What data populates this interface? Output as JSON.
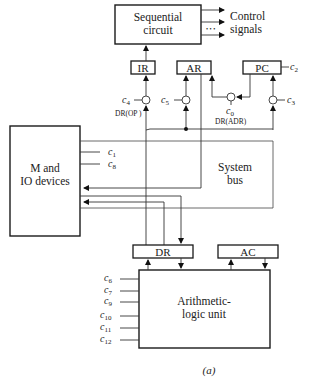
{
  "blocks": {
    "sequential_circuit": [
      "Sequential",
      "circuit"
    ],
    "control_signals": [
      "Control",
      "signals"
    ],
    "control_dots": "• • •",
    "ir": "IR",
    "ar": "AR",
    "pc": "PC",
    "m_io": [
      "M and",
      "IO devices"
    ],
    "system_bus": [
      "System",
      "bus"
    ],
    "dr": "DR",
    "ac": "AC",
    "alu": [
      "Arithmetic-",
      "logic unit"
    ]
  },
  "signals": {
    "c0": {
      "base": "c",
      "sub": "0"
    },
    "c1": {
      "base": "c",
      "sub": "1"
    },
    "c2": {
      "base": "c",
      "sub": "2"
    },
    "c3": {
      "base": "c",
      "sub": "3"
    },
    "c4": {
      "base": "c",
      "sub": "4"
    },
    "c5": {
      "base": "c",
      "sub": "5"
    },
    "c6": {
      "base": "c",
      "sub": "6"
    },
    "c7": {
      "base": "c",
      "sub": "7"
    },
    "c8": {
      "base": "c",
      "sub": "8"
    },
    "c9": {
      "base": "c",
      "sub": "9"
    },
    "c10": {
      "base": "c",
      "sub": "10"
    },
    "c11": {
      "base": "c",
      "sub": "11"
    },
    "c12": {
      "base": "c",
      "sub": "12"
    }
  },
  "field_labels": {
    "dr_op": "DR(OP )",
    "dr_adr": "DR(ADR)"
  },
  "caption": "(a)"
}
